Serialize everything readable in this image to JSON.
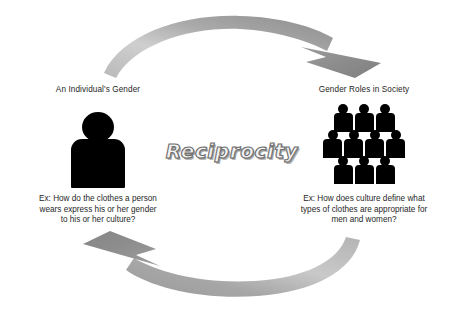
{
  "diagram": {
    "center_label": "Reciprocity",
    "background_color": "#ffffff",
    "arrow_color_light": "#c2c2c2",
    "arrow_color_dark": "#8a8a8a",
    "figure_color": "#000000",
    "text_color": "#1f1f1f"
  },
  "nodes": {
    "individual": {
      "title": "An Individual's Gender",
      "icon": "single-person-silhouette",
      "caption_lines": [
        "Ex: How do the clothes a person",
        "wears express his or her gender",
        "to his or her culture?"
      ]
    },
    "society": {
      "title": "Gender Roles in Society",
      "icon": "group-of-people-silhouette",
      "group_rows": [
        3,
        4,
        3
      ],
      "caption_lines": [
        "Ex: How does culture define what",
        "types of clothes are appropriate for",
        "men and women?"
      ]
    }
  },
  "arrows": {
    "top": {
      "name": "arrow-individual-to-society",
      "direction": "left-to-right"
    },
    "bottom": {
      "name": "arrow-society-to-individual",
      "direction": "right-to-left"
    }
  }
}
